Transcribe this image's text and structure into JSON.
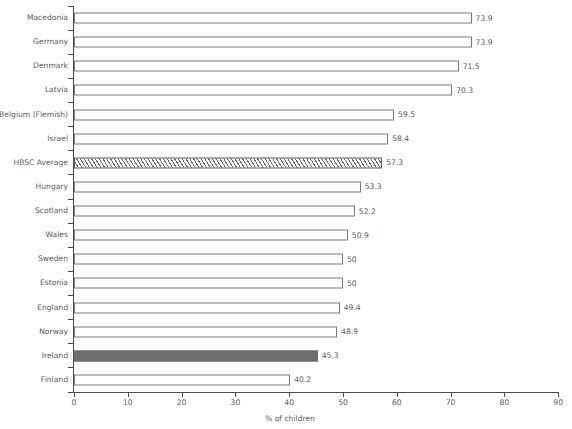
{
  "chart_data": {
    "type": "bar",
    "orientation": "horizontal",
    "title": "",
    "subtitle": "",
    "xlabel": "% of children",
    "ylabel": "",
    "xlim": [
      0,
      90
    ],
    "xticks": [
      0,
      10,
      20,
      30,
      40,
      50,
      60,
      70,
      80,
      90
    ],
    "grid": false,
    "legend": false,
    "categories": [
      "Macedonia",
      "Germany",
      "Denmark",
      "Latvia",
      "Belgium (Flemish)",
      "Israel",
      "HBSC Average",
      "Hungary",
      "Scotland",
      "Wales",
      "Sweden",
      "Estonia",
      "England",
      "Norway",
      "Ireland",
      "Finland"
    ],
    "values": [
      73.9,
      73.9,
      71.5,
      70.3,
      59.5,
      58.4,
      57.3,
      53.3,
      52.2,
      50.9,
      50,
      50,
      49.4,
      48.9,
      45.3,
      40.2
    ],
    "value_labels": [
      "73.9",
      "73.9",
      "71.5",
      "70.3",
      "59.5",
      "58.4",
      "57.3",
      "53.3",
      "52.2",
      "50.9",
      "50",
      "50",
      "49.4",
      "48.9",
      "45.3",
      "40.2"
    ],
    "bar_styles": [
      "outline",
      "outline",
      "outline",
      "outline",
      "outline",
      "outline",
      "hatched",
      "outline",
      "outline",
      "outline",
      "outline",
      "outline",
      "outline",
      "outline",
      "solid",
      "outline"
    ],
    "colors": {
      "outline_fill": "#ffffff",
      "outline_stroke": "#7a7a7a",
      "hatched_stroke": "#5a5a5a",
      "hatched_line": "#6a6a6a",
      "solid_fill": "#6e6e6e",
      "axis": "#4d4d4d",
      "text": "#5a5a5a",
      "background": "#ffffff"
    }
  }
}
